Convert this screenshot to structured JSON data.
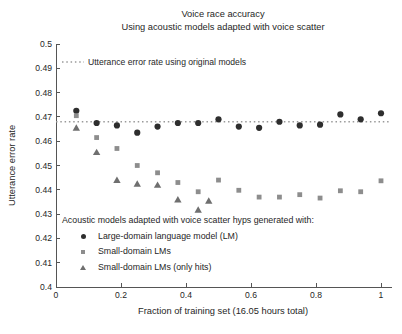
{
  "title": "Voice race accuracy",
  "subtitle": "Using acoustic models adapted with voice scatter",
  "reference_legend_label": "Utterance error rate using original models",
  "axes": {
    "xlabel": "Fraction of training set (16.05 hours total)",
    "ylabel": "Utterance error rate"
  },
  "plot_legend": {
    "heading": "Acoustic models adapted with voice scatter hyps generated with:",
    "items": [
      {
        "marker": "circle",
        "label": "Large-domain language model (LM)"
      },
      {
        "marker": "square",
        "label": "Small-domain LMs"
      },
      {
        "marker": "triangle",
        "label": "Small-domain LMs (only hits)"
      }
    ]
  },
  "colors": {
    "circle_series": "#2e2e2e",
    "square_series": "#8d8d8d",
    "triangle_series": "#6f6f6f",
    "reference_line": "#9a9a9a",
    "axis": "#555555",
    "text": "#262626"
  },
  "chart_data": {
    "type": "scatter",
    "title": "Voice race accuracy",
    "subtitle": "Using acoustic models adapted with voice scatter",
    "xlabel": "Fraction of training set (16.05 hours total)",
    "ylabel": "Utterance error rate",
    "xlim": [
      0,
      1
    ],
    "ylim": [
      0.4,
      0.5
    ],
    "x_ticks": [
      0,
      0.2,
      0.4,
      0.6,
      0.8,
      1
    ],
    "y_ticks": [
      0.4,
      0.41,
      0.42,
      0.43,
      0.44,
      0.45,
      0.46,
      0.47,
      0.48,
      0.49,
      0.5
    ],
    "grid": false,
    "reference_line": {
      "value": 0.468,
      "style": "dotted",
      "label": "Utterance error rate using original models"
    },
    "series": [
      {
        "name": "Large-domain language model (LM)",
        "marker": "circle",
        "color": "#2e2e2e",
        "x": [
          0.0625,
          0.125,
          0.1875,
          0.25,
          0.3125,
          0.375,
          0.4375,
          0.5,
          0.5625,
          0.625,
          0.6875,
          0.75,
          0.8125,
          0.875,
          0.9375,
          1.0
        ],
        "y": [
          0.4725,
          0.4675,
          0.4665,
          0.4635,
          0.466,
          0.4675,
          0.4675,
          0.469,
          0.466,
          0.4655,
          0.468,
          0.4665,
          0.4668,
          0.471,
          0.469,
          0.4715
        ]
      },
      {
        "name": "Small-domain LMs",
        "marker": "square",
        "color": "#8d8d8d",
        "x": [
          0.0625,
          0.125,
          0.1875,
          0.25,
          0.3125,
          0.375,
          0.4375,
          0.5,
          0.5625,
          0.625,
          0.6875,
          0.75,
          0.8125,
          0.875,
          0.9375,
          1.0
        ],
        "y": [
          0.4705,
          0.4615,
          0.457,
          0.45,
          0.447,
          0.443,
          0.4392,
          0.444,
          0.4398,
          0.437,
          0.437,
          0.438,
          0.4366,
          0.4396,
          0.4392,
          0.4437
        ]
      },
      {
        "name": "Small-domain LMs (only hits)",
        "marker": "triangle",
        "color": "#6f6f6f",
        "x": [
          0.0625,
          0.125,
          0.1875,
          0.25,
          0.3125,
          0.375,
          0.4375,
          0.47
        ],
        "y": [
          0.4655,
          0.4555,
          0.444,
          0.4425,
          0.442,
          0.436,
          0.4318,
          0.4355
        ]
      }
    ]
  }
}
